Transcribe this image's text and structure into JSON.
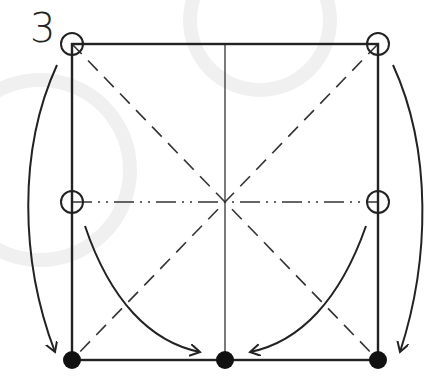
{
  "diagram": {
    "type": "origami-fold-diagram",
    "step_number": "3",
    "colors": {
      "line": "#222222",
      "crease": "#333333",
      "background": "#ffffff",
      "watermark": "#f2f2f2"
    },
    "square": {
      "x": 72,
      "y": 44,
      "size": 316
    },
    "elements": {
      "outline": "solid square",
      "vertical_center_crease": "thin solid line",
      "diagonals": "dashed valley lines",
      "horizontal_midline": "dash-dot mountain line",
      "open_circles": [
        "top-left corner",
        "top-right corner",
        "left edge midpoint",
        "right edge midpoint"
      ],
      "filled_dots": [
        "bottom-left corner",
        "bottom center",
        "bottom-right corner"
      ],
      "arrows": [
        "top-left corner to bottom-left corner (outer arc)",
        "top-right corner to bottom-right corner (outer arc)",
        "left midpoint to bottom center (inner arc)",
        "right midpoint to bottom center (inner arc)"
      ]
    }
  }
}
